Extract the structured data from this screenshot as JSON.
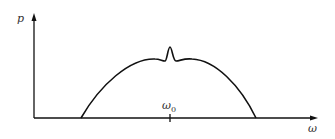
{
  "diagram": {
    "y_axis_label": "p",
    "x_axis_label": "ω",
    "center_label": "ω",
    "center_label_sub": "0",
    "line_color": "#111111"
  }
}
